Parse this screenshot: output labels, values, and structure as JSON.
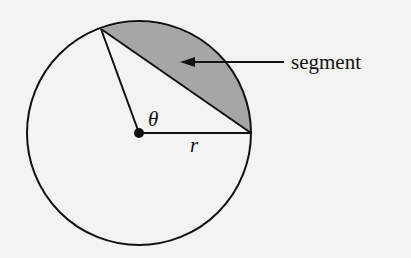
{
  "diagram": {
    "labels": {
      "segment": "segment",
      "theta": "θ",
      "radius": "r"
    },
    "colors": {
      "background": "#f3f3f1",
      "stroke": "#111111",
      "segment_fill": "#a6a6a6"
    },
    "geometry": {
      "center": [
        139,
        133
      ],
      "radius": 112,
      "point_a": [
        251,
        133
      ],
      "point_b": [
        101,
        29
      ]
    }
  }
}
